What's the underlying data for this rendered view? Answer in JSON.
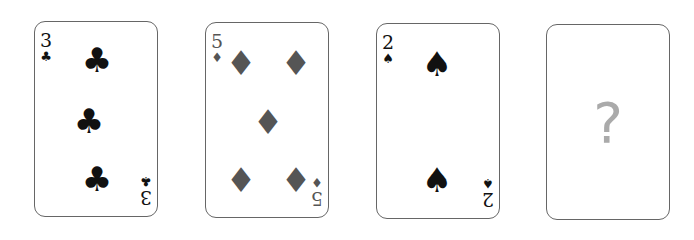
{
  "cards": [
    {
      "rank": "3",
      "suit": "♣",
      "suit_name": "clubs",
      "color": "#111111"
    },
    {
      "rank": "5",
      "suit": "♦",
      "suit_name": "diamonds",
      "color": "#555555"
    },
    {
      "rank": "2",
      "suit": "♠",
      "suit_name": "spades",
      "color": "#111111"
    },
    {
      "rank": "",
      "suit": "",
      "suit_name": "unknown",
      "label": "?",
      "color": "#aaaaaa"
    }
  ]
}
